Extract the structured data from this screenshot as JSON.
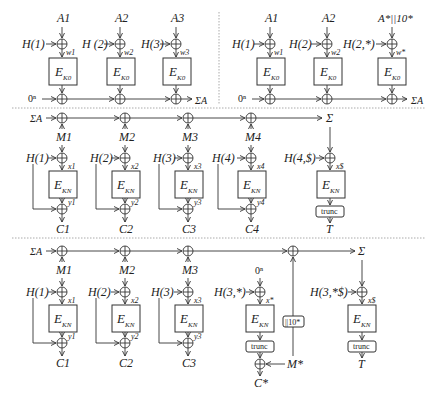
{
  "top_left": {
    "inputs": [
      "A1",
      "A2",
      "A3"
    ],
    "tweaks": [
      "H(1)",
      "H (2)",
      "H(3)"
    ],
    "wires": [
      "w1",
      "w2",
      "w3"
    ],
    "block_label": "E",
    "block_key": "K0",
    "init": "0ⁿ",
    "output": "ΣA"
  },
  "top_right": {
    "inputs": [
      "A1",
      "A2",
      "A*||10*"
    ],
    "tweaks": [
      "H(1)",
      "H(2)",
      "H(2,*)"
    ],
    "wires": [
      "w1",
      "w2",
      "w*"
    ],
    "block_label": "E",
    "block_key": "K0",
    "init": "0ⁿ",
    "output": "ΣA"
  },
  "middle": {
    "start": "ΣA",
    "messages": [
      "M1",
      "M2",
      "M3",
      "M4"
    ],
    "tweaks": [
      "H(1)",
      "H(2)",
      "H(3)",
      "H(4)"
    ],
    "x_wires": [
      "x1",
      "x2",
      "x3",
      "x4"
    ],
    "y_wires": [
      "y1",
      "y2",
      "y3",
      "y4"
    ],
    "ciphertexts": [
      "C1",
      "C2",
      "C3",
      "C4"
    ],
    "sum": "Σ",
    "tag_tweak": "H(4,$)",
    "tag_wire": "x$",
    "block_label": "E",
    "block_key": "KN",
    "trunc_label": "trunc",
    "tag": "T"
  },
  "bottom": {
    "start": "ΣA",
    "messages": [
      "M1",
      "M2",
      "M3"
    ],
    "tweaks": [
      "H(1)",
      "H(2)",
      "H(3)"
    ],
    "x_wires": [
      "x1",
      "x2",
      "x3"
    ],
    "y_wires": [
      "y1",
      "y2",
      "y3"
    ],
    "ciphertexts": [
      "C1",
      "C2",
      "C3"
    ],
    "partial_input": "0ⁿ",
    "partial_tweak": "H(3,*)",
    "partial_wire": "x*",
    "partial_trunc": "trunc",
    "partial_msg": "M*",
    "partial_cipher": "C*",
    "pad_label": "||10*",
    "sum": "Σ",
    "tag_tweak": "H(3,*$)",
    "tag_wire": "x$",
    "block_label": "E",
    "block_key": "KN",
    "trunc_label": "trunc",
    "tag": "T"
  }
}
